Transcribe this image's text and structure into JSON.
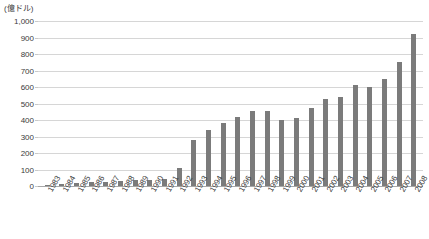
{
  "chart_data": {
    "type": "bar",
    "title": "",
    "unit_caption": "(億ドル)",
    "xlabel": "",
    "ylabel": "",
    "ylim": [
      0,
      1000
    ],
    "ytick_step": 100,
    "grid": true,
    "legend": "none",
    "bar_color": "#7b7b7b",
    "gridline_color": "#d6d6d6",
    "axis_color": "#a8a8a8",
    "yticks": [
      "1,000",
      "900",
      "800",
      "700",
      "600",
      "500",
      "400",
      "300",
      "200",
      "100",
      "0"
    ],
    "categories": [
      "1983",
      "1984",
      "1985",
      "1986",
      "1987",
      "1988",
      "1989",
      "1990",
      "1991",
      "1992",
      "1993",
      "1994",
      "1995",
      "1996",
      "1997",
      "1998",
      "1999",
      "2000",
      "2001",
      "2002",
      "2003",
      "2004",
      "2005",
      "2006",
      "2007",
      "2008"
    ],
    "values": [
      9,
      15,
      20,
      23,
      23,
      32,
      34,
      35,
      44,
      110,
      280,
      340,
      380,
      420,
      455,
      455,
      400,
      410,
      470,
      530,
      540,
      610,
      600,
      650,
      750,
      920
    ]
  }
}
